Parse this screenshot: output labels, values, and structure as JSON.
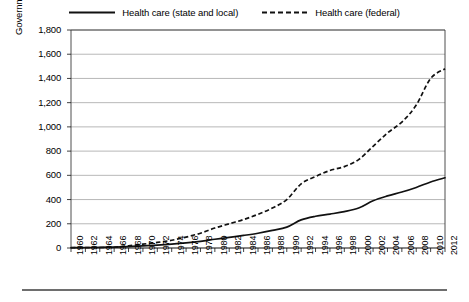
{
  "legend": {
    "position": "top-center",
    "entries": [
      {
        "label": "Health care (state and local)",
        "style": "solid",
        "swatch_name": "legend-swatch-solid"
      },
      {
        "label": "Health care (federal)",
        "style": "dashed",
        "swatch_name": "legend-swatch-dashed"
      }
    ]
  },
  "axes": {
    "y_title": "Government spending in billions of dollars",
    "y_ticks": [
      "0",
      "200",
      "400",
      "600",
      "800",
      "1,000",
      "1,200",
      "1,400",
      "1,600",
      "1,800"
    ],
    "x_ticks": [
      "1960",
      "1962",
      "1964",
      "1966",
      "1968",
      "1970",
      "1972",
      "1974",
      "1976",
      "1978",
      "1980",
      "1982",
      "1984",
      "1986",
      "1988",
      "1990",
      "1992",
      "1994",
      "1996",
      "1998",
      "2000",
      "2002",
      "2004",
      "2006",
      "2008",
      "2010",
      "2012"
    ]
  },
  "chart_data": {
    "type": "line",
    "title": "",
    "subtitle": "",
    "xlabel": "",
    "ylabel": "Government spending in billions of dollars",
    "xlim": [
      1960,
      2012
    ],
    "ylim": [
      0,
      1800
    ],
    "ytick_step": 200,
    "xtick_step": 2,
    "grid": "horizontal",
    "legend_position": "top-center",
    "x": [
      1960,
      1962,
      1964,
      1966,
      1968,
      1970,
      1972,
      1974,
      1976,
      1978,
      1980,
      1982,
      1984,
      1986,
      1988,
      1990,
      1992,
      1994,
      1996,
      1998,
      2000,
      2002,
      2004,
      2006,
      2008,
      2010,
      2012
    ],
    "series": [
      {
        "name": "Health care (state and local)",
        "style": "solid",
        "color": "#111111",
        "values": [
          3,
          4,
          5,
          8,
          12,
          18,
          24,
          32,
          42,
          55,
          72,
          88,
          104,
          122,
          145,
          172,
          232,
          262,
          280,
          300,
          330,
          390,
          430,
          462,
          500,
          545,
          580
        ]
      },
      {
        "name": "Health care (federal)",
        "style": "dashed",
        "color": "#111111",
        "values": [
          2,
          3,
          4,
          6,
          18,
          32,
          46,
          64,
          90,
          122,
          165,
          200,
          235,
          278,
          330,
          400,
          530,
          590,
          640,
          672,
          730,
          840,
          950,
          1040,
          1180,
          1400,
          1480
        ]
      }
    ]
  }
}
